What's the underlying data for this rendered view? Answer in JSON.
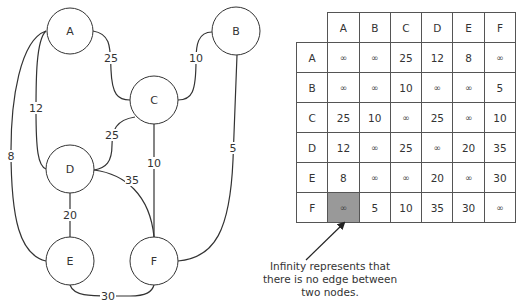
{
  "graph": {
    "nodes": [
      {
        "id": "A",
        "label": "A",
        "cx": 70,
        "cy": 31,
        "r": 23
      },
      {
        "id": "B",
        "label": "B",
        "cx": 236,
        "cy": 31,
        "r": 24
      },
      {
        "id": "C",
        "label": "C",
        "cx": 154,
        "cy": 100,
        "r": 24
      },
      {
        "id": "D",
        "label": "D",
        "cx": 70,
        "cy": 169,
        "r": 24
      },
      {
        "id": "E",
        "label": "E",
        "cx": 70,
        "cy": 261,
        "r": 24
      },
      {
        "id": "F",
        "label": "F",
        "cx": 154,
        "cy": 261,
        "r": 24
      }
    ],
    "edges": [
      {
        "from": "A",
        "to": "C",
        "weight": "25"
      },
      {
        "from": "A",
        "to": "D",
        "weight": "12"
      },
      {
        "from": "A",
        "to": "E",
        "weight": "8"
      },
      {
        "from": "B",
        "to": "C",
        "weight": "10"
      },
      {
        "from": "B",
        "to": "F",
        "weight": "5"
      },
      {
        "from": "C",
        "to": "D",
        "weight": "25"
      },
      {
        "from": "C",
        "to": "F",
        "weight": "10"
      },
      {
        "from": "D",
        "to": "E",
        "weight": "20"
      },
      {
        "from": "D",
        "to": "F",
        "weight": "35"
      },
      {
        "from": "E",
        "to": "F",
        "weight": "30"
      }
    ]
  },
  "matrix": {
    "headers": [
      "A",
      "B",
      "C",
      "D",
      "E",
      "F"
    ],
    "rows": [
      {
        "label": "A",
        "cells": [
          "∞",
          "∞",
          "25",
          "12",
          "8",
          "∞"
        ]
      },
      {
        "label": "B",
        "cells": [
          "∞",
          "∞",
          "10",
          "∞",
          "∞",
          "5"
        ]
      },
      {
        "label": "C",
        "cells": [
          "25",
          "10",
          "∞",
          "25",
          "∞",
          "10"
        ]
      },
      {
        "label": "D",
        "cells": [
          "12",
          "∞",
          "25",
          "∞",
          "20",
          "35"
        ]
      },
      {
        "label": "E",
        "cells": [
          "8",
          "∞",
          "∞",
          "20",
          "∞",
          "30"
        ]
      },
      {
        "label": "F",
        "cells": [
          "∞",
          "5",
          "10",
          "35",
          "30",
          "∞"
        ]
      }
    ],
    "highlight": {
      "row": 5,
      "col": 0,
      "color": "#999999"
    }
  },
  "annotation": {
    "line1": "Infinity represents that",
    "line2": "there is no edge between",
    "line3": "two nodes."
  }
}
